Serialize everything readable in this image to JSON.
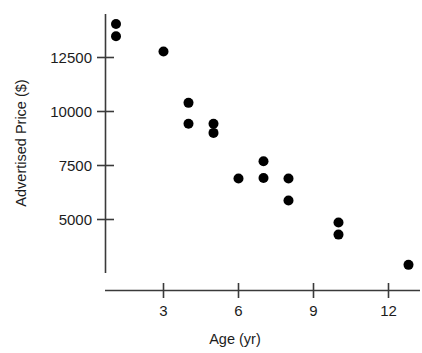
{
  "chart_data": {
    "type": "scatter",
    "title": "",
    "xlabel": "Age (yr)",
    "ylabel": "Advertised Price ($)",
    "xlim": [
      0.2,
      13.4
    ],
    "ylim": [
      2200,
      14600
    ],
    "xticks": [
      3,
      6,
      9,
      12
    ],
    "xtick_labels": [
      "3",
      "6",
      "9",
      "12"
    ],
    "yticks": [
      5000,
      7500,
      10000,
      12500
    ],
    "ytick_labels": [
      "5000",
      "7500",
      "10000",
      "12500"
    ],
    "grid": false,
    "legend": null,
    "marker": "filled-circle",
    "marker_color": "#000000",
    "n_points": 16,
    "x": [
      1.1,
      1.1,
      3.0,
      4.0,
      4.0,
      5.0,
      5.0,
      6.0,
      7.0,
      7.0,
      8.0,
      8.0,
      10.0,
      10.0,
      12.8
    ],
    "y": [
      14050,
      13480,
      12780,
      10400,
      9430,
      9430,
      9010,
      6900,
      7700,
      6920,
      6900,
      5880,
      4860,
      4300,
      2900
    ],
    "points": [
      {
        "age": 1.1,
        "price": 14050
      },
      {
        "age": 1.1,
        "price": 13480
      },
      {
        "age": 3.0,
        "price": 12780
      },
      {
        "age": 4.0,
        "price": 10400
      },
      {
        "age": 4.0,
        "price": 9430
      },
      {
        "age": 5.0,
        "price": 9430
      },
      {
        "age": 5.0,
        "price": 9010
      },
      {
        "age": 6.0,
        "price": 6900
      },
      {
        "age": 7.0,
        "price": 7700
      },
      {
        "age": 7.0,
        "price": 6920
      },
      {
        "age": 8.0,
        "price": 6900
      },
      {
        "age": 8.0,
        "price": 5880
      },
      {
        "age": 10.0,
        "price": 4860
      },
      {
        "age": 10.0,
        "price": 4300
      },
      {
        "age": 12.8,
        "price": 2900
      }
    ]
  },
  "axes": {
    "x_axis_name": "age-axis",
    "y_axis_name": "price-axis"
  }
}
